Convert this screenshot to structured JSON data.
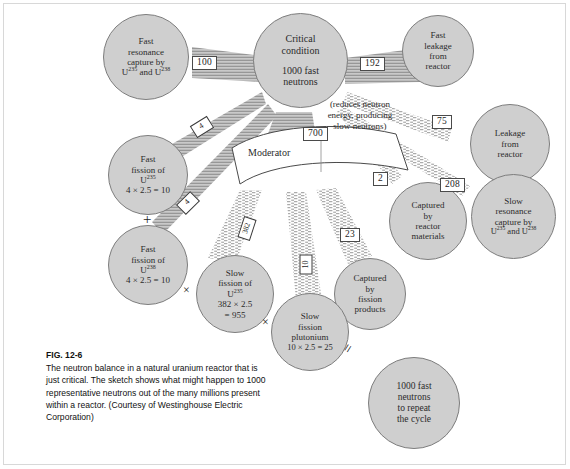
{
  "figure": {
    "label": "FIG. 12-6",
    "caption": "The neutron balance in a natural uranium reactor that is just critical.  The sketch shows what might happen to 1000 representative neutrons out of the many millions present within a reactor.  (Courtesy of Westinghouse Electric Corporation)"
  },
  "colors": {
    "node_fill": "#cfcfcf",
    "node_stroke": "#7d7d7d",
    "flow_stroke": "#555555",
    "box_stroke": "#4a4a4a",
    "text": "#2b2b2b",
    "page_bg": "#ffffff"
  },
  "nodes": {
    "critical": {
      "name": "critical-condition",
      "line1": "Critical",
      "line2": "condition",
      "line3": "1000 fast",
      "line4": "neutrons"
    },
    "fast_resonance_capture": {
      "name": "fast-resonance-capture",
      "line1": "Fast",
      "line2": "resonance",
      "line3": "capture by",
      "line4_a": "U",
      "line4_sup1": "235",
      "line4_b": " and U",
      "line4_sup2": "238"
    },
    "fast_leakage": {
      "name": "fast-leakage-from-reactor",
      "line1": "Fast",
      "line2": "leakage",
      "line3": "from",
      "line4": "reactor"
    },
    "leakage": {
      "name": "leakage-from-reactor",
      "line1": "Leakage",
      "line2": "from",
      "line3": "reactor"
    },
    "slow_resonance_capture": {
      "name": "slow-resonance-capture",
      "line1": "Slow",
      "line2": "resonance",
      "line3": "capture by",
      "line4_a": "U",
      "line4_sup1": "235",
      "line4_b": " and U",
      "line4_sup2": "238"
    },
    "captured_reactor_materials": {
      "name": "captured-by-reactor-materials",
      "line1": "Captured",
      "line2": "by",
      "line3": "reactor",
      "line4": "materials"
    },
    "captured_fission_products": {
      "name": "captured-by-fission-products",
      "line1": "Captured",
      "line2": "by",
      "line3": "fission",
      "line4": "products"
    },
    "fast_fission_u235": {
      "name": "fast-fission-u235",
      "line1": "Fast",
      "line2": "fission of",
      "line3_a": "U",
      "line3_sup": "235",
      "line4": "4 × 2.5 = 10"
    },
    "fast_fission_u238": {
      "name": "fast-fission-u238",
      "line1": "Fast",
      "line2": "fission of",
      "line3_a": "U",
      "line3_sup": "238",
      "line4": "4 × 2.5 = 10"
    },
    "slow_fission_u235": {
      "name": "slow-fission-u235",
      "line1": "Slow",
      "line2": "fission of",
      "line3_a": "U",
      "line3_sup": "235",
      "line4": "382 × 2.5",
      "line5": "= 955"
    },
    "slow_fission_pu": {
      "name": "slow-fission-plutonium",
      "line1": "Slow",
      "line2": "fission",
      "line3": "plutonium",
      "line4": "10 × 2.5 = 25"
    },
    "result": {
      "name": "result-1000-fast-neutrons",
      "line1": "1000 fast",
      "line2": "neutrons",
      "line3": "to repeat",
      "line4": "the cycle"
    }
  },
  "moderator": {
    "label": "Moderator",
    "note_line1": "(reduces",
    "note_line2": "neutron",
    "note_line3": "energy,",
    "note_line4": "producing",
    "note_line5": "slow",
    "note_line6": "neutrons)"
  },
  "flow_labels": {
    "fast_resonance_capture": "100",
    "fast_leakage": "192",
    "to_moderator": "700",
    "leakage": "75",
    "captured_reactor_materials": "2",
    "slow_resonance_capture": "208",
    "captured_fission_products": "23",
    "fast_fission_u235": "4",
    "fast_fission_u238": "4",
    "slow_fission_u235": "382",
    "slow_fission_pu": "10"
  },
  "operators": {
    "plus_left": "+",
    "times_mid_left": "×",
    "times_mid_right": "×",
    "equals_bottom": "="
  }
}
